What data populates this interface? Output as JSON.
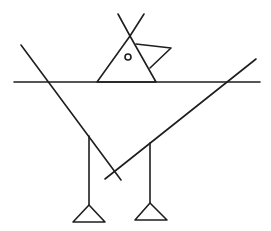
{
  "figure": {
    "width": 271,
    "height": 231,
    "stroke_color": "#1e1e1e",
    "background": "#ffffff",
    "parts": {
      "horizon_line": {
        "x1": 14,
        "y1": 82,
        "x2": 260,
        "y2": 82
      },
      "body_left_diagonal": {
        "x1": 21,
        "y1": 45,
        "x2": 121,
        "y2": 180
      },
      "body_right_diagonal": {
        "x1": 256,
        "y1": 59,
        "x2": 105,
        "y2": 179
      },
      "head_triangle": [
        [
          97,
          82
        ],
        [
          130,
          36
        ],
        [
          156,
          82
        ]
      ],
      "crest_left": {
        "x1": 118,
        "y1": 14,
        "x2": 130,
        "y2": 36
      },
      "crest_right": {
        "x1": 144,
        "y1": 14,
        "x2": 130,
        "y2": 36
      },
      "beak": [
        [
          136,
          44
        ],
        [
          171,
          48
        ],
        [
          150,
          68
        ]
      ],
      "eye": {
        "cx": 128,
        "cy": 57,
        "r": 3
      },
      "left_leg": {
        "x1": 89,
        "y1": 136,
        "x2": 89,
        "y2": 205
      },
      "right_leg": {
        "x1": 150,
        "y1": 143,
        "x2": 150,
        "y2": 203
      },
      "left_foot": [
        [
          89,
          205
        ],
        [
          73,
          222
        ],
        [
          105,
          222
        ]
      ],
      "right_foot": [
        [
          150,
          203
        ],
        [
          135,
          220
        ],
        [
          167,
          220
        ]
      ]
    }
  }
}
